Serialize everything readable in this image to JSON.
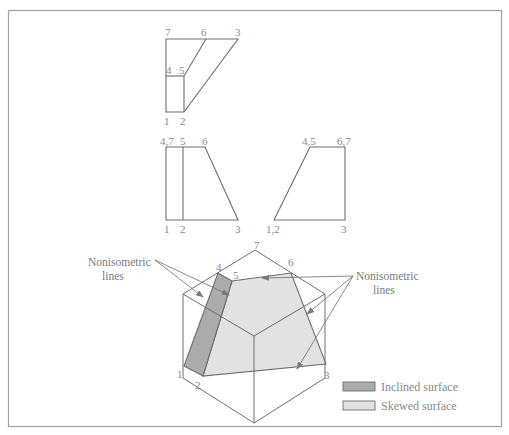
{
  "figure": {
    "border_color": "#a0a0a0",
    "line_color": "#6e6e6e",
    "label_color": "#8a8a8a"
  },
  "top_view": {
    "labels": {
      "p7": "7",
      "p6": "6",
      "p3": "3",
      "p4": "4",
      "p5": "5",
      "p1": "1",
      "p2": "2"
    }
  },
  "front_view": {
    "labels": {
      "p47": "4,7",
      "p5": "5",
      "p6": "6",
      "p1": "1",
      "p2": "2",
      "p3": "3"
    }
  },
  "side_view": {
    "labels": {
      "p45": "4,5",
      "p67": "6,7",
      "p12": "1,2",
      "p3": "3"
    }
  },
  "isometric": {
    "labels": {
      "p7": "7",
      "p4": "4",
      "p5": "5",
      "p6": "6",
      "p1": "1",
      "p2": "2",
      "p3": "3"
    },
    "inclined_fill": "#ababab",
    "skewed_fill": "#e2e2e2"
  },
  "annotations": {
    "left_line1": "Nonisometric",
    "left_line2": "lines",
    "right_line1": "Nonisometric",
    "right_line2": "lines"
  },
  "legend": {
    "items": [
      {
        "label": "Inclined surface",
        "color": "#ababab"
      },
      {
        "label": "Skewed surface",
        "color": "#e2e2e2"
      }
    ]
  }
}
